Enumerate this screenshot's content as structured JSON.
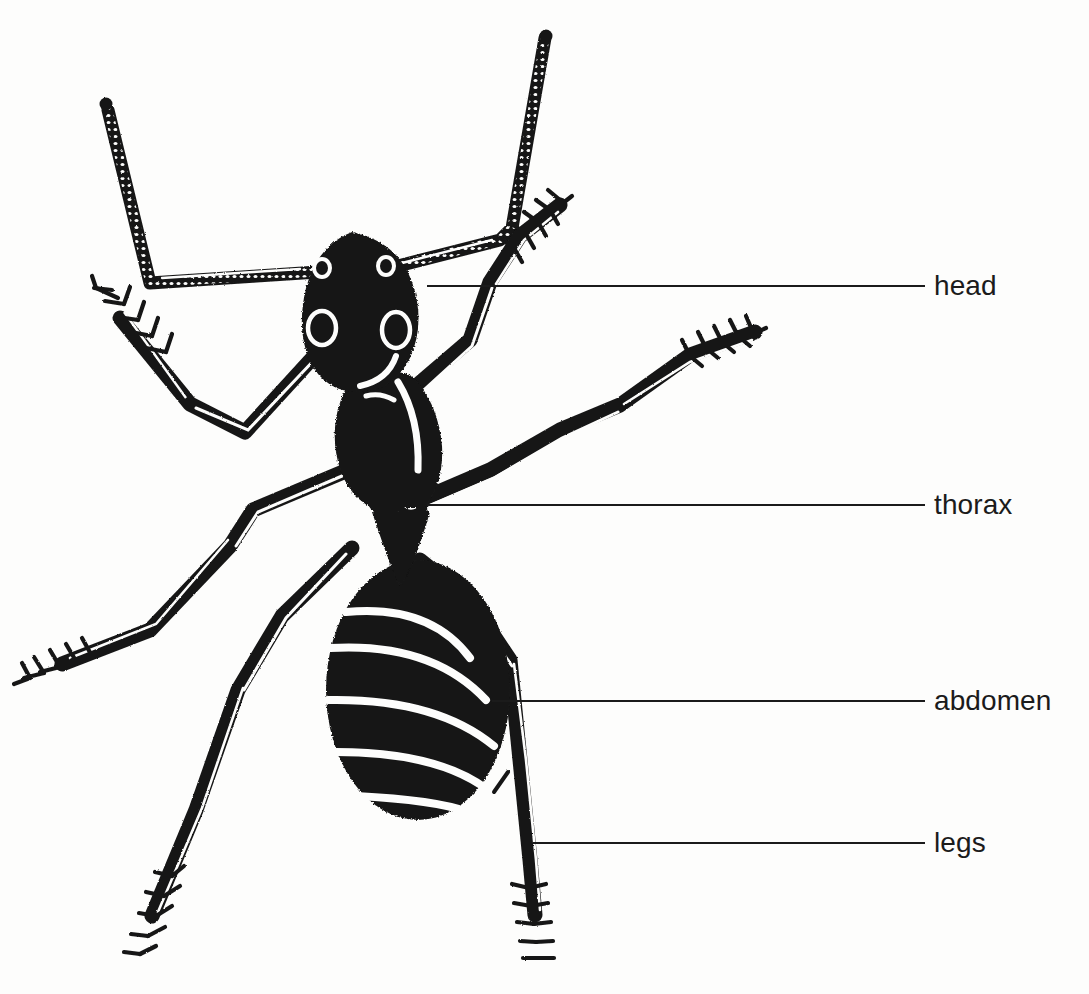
{
  "figure": {
    "view": "dorsal",
    "background_color": "#fdfdfc",
    "ink_color": "#171717",
    "text_color": "#1b1b1b",
    "width": 1089,
    "height": 994
  },
  "labels": [
    {
      "id": "head",
      "text": "head",
      "leader_line": {
        "x1": 427,
        "y1": 286,
        "x2": 925,
        "y2": 286
      }
    },
    {
      "id": "thorax",
      "text": "thorax",
      "leader_line": {
        "x1": 427,
        "y1": 505,
        "x2": 925,
        "y2": 505
      }
    },
    {
      "id": "abdomen",
      "text": "abdomen",
      "leader_line": {
        "x1": 492,
        "y1": 701,
        "x2": 925,
        "y2": 701
      }
    },
    {
      "id": "legs",
      "text": "legs",
      "leader_line": {
        "x1": 533,
        "y1": 843,
        "x2": 925,
        "y2": 843
      }
    }
  ],
  "anatomy_parts": {
    "head": "head",
    "thorax": "thorax",
    "abdomen": "abdomen",
    "legs": "legs",
    "antennae": "antennae",
    "petiole": "petiole",
    "eyes": "compound-eyes",
    "tarsus": "tarsus"
  }
}
